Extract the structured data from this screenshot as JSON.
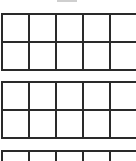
{
  "worksheet": {
    "header_clipped": true,
    "line_color": "#2a2a2a",
    "frames": [
      {
        "id": "ten-frame-1",
        "top": 13,
        "rows": 2,
        "cols": 5,
        "filled": []
      },
      {
        "id": "ten-frame-2",
        "top": 81,
        "rows": 2,
        "cols": 5,
        "filled": []
      },
      {
        "id": "ten-frame-3",
        "top": 150,
        "rows": 1,
        "cols": 5,
        "filled": [],
        "clipped": true
      }
    ]
  }
}
